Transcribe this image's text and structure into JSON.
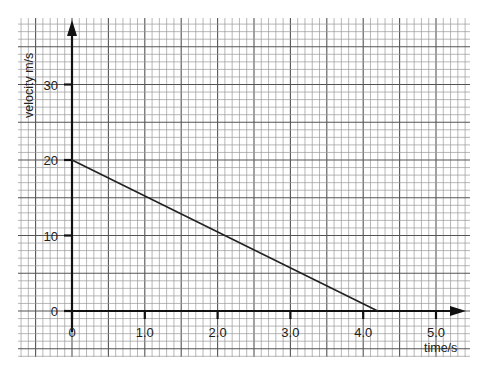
{
  "chart_data": {
    "type": "line",
    "title": "",
    "xlabel": "time/s",
    "ylabel": "velocity m/s",
    "xlim": [
      0,
      5.0
    ],
    "ylim": [
      0,
      30
    ],
    "x_ticks": [
      "0",
      "1.0",
      "2.0",
      "3.0",
      "4.0",
      "5.0"
    ],
    "y_ticks": [
      "0",
      "10",
      "20",
      "30"
    ],
    "grid": true,
    "legend": null,
    "series": [
      {
        "name": "velocity",
        "x": [
          0,
          4.2
        ],
        "y": [
          20,
          0
        ]
      }
    ]
  },
  "colors": {
    "grid_minor": "#9a9a9a",
    "grid_major": "#555555",
    "axis": "#111111",
    "line": "#222222"
  }
}
